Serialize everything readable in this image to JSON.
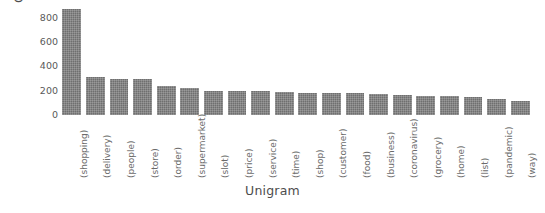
{
  "chart_data": {
    "type": "bar",
    "title": "",
    "xlabel": "Unigram",
    "ylabel": "Count",
    "ylim": [
      0,
      880
    ],
    "yticks": [
      0,
      200,
      400,
      600,
      800
    ],
    "ytick_labels": [
      "0",
      "200",
      "400",
      "600",
      "800"
    ],
    "grid": false,
    "legend": false,
    "bar_color": "#6f6f6f",
    "categories": [
      "(shopping)",
      "(delivery)",
      "(people)",
      "(store)",
      "(order)",
      "(supermarket)",
      "(slot)",
      "(price)",
      "(service)",
      "(time)",
      "(shop)",
      "(customer)",
      "(food)",
      "(business)",
      "(coronavirus)",
      "(grocery)",
      "(home)",
      "(list)",
      "(pandemic)",
      "(way)"
    ],
    "values": [
      870,
      310,
      300,
      295,
      235,
      225,
      200,
      200,
      195,
      190,
      185,
      180,
      180,
      175,
      165,
      160,
      155,
      150,
      130,
      115
    ]
  }
}
